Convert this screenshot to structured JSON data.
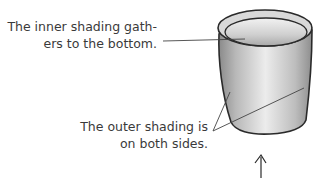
{
  "annotations": {
    "inner": {
      "line1": "The inner shading gath-",
      "line2": "ers to the bottom."
    },
    "outer": {
      "line1": "The outer shading is",
      "line2": "on both sides."
    }
  },
  "illustration": {
    "subject": "cup-drawing",
    "icon": "up-arrow-icon"
  },
  "colors": {
    "text": "#3a3a3a",
    "outline": "#2a2a2a",
    "shade_dark": "#8c8c8c",
    "shade_light": "#e6e6e6"
  }
}
